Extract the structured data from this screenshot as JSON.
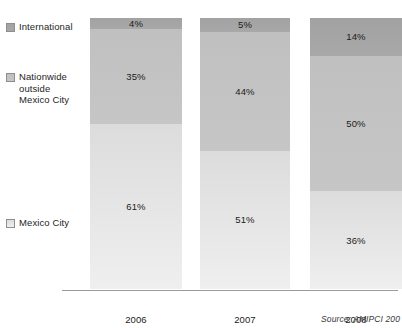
{
  "chart_data": {
    "type": "bar",
    "subtype": "100% stacked column",
    "title": "",
    "xlabel": "",
    "ylabel": "",
    "ylim": [
      0,
      100
    ],
    "grid": false,
    "legend_position": "left",
    "categories": [
      "2006",
      "2007",
      "2008"
    ],
    "category_totals": [
      "$537M USD",
      "$955M USD",
      "$1,768M USD"
    ],
    "series": [
      {
        "name": "International",
        "color": "#a5a5a5",
        "values": [
          4,
          5,
          14
        ],
        "labels": [
          "4%",
          "5%",
          "14%"
        ]
      },
      {
        "name": "Nationwide\noutside\nMexico City",
        "color": "#c3c3c3",
        "values": [
          35,
          44,
          50
        ],
        "labels": [
          "35%",
          "44%",
          "50%"
        ]
      },
      {
        "name": "Mexico City",
        "color": "#e4e4e4",
        "values": [
          61,
          51,
          36
        ],
        "labels": [
          "61%",
          "51%",
          "36%"
        ]
      }
    ],
    "annotations": [
      "Source: AMIPCI 200"
    ]
  },
  "legend": {
    "items": [
      {
        "label": "International",
        "color": "#a5a5a5"
      },
      {
        "label": "Nationwide\noutside\nMexico City",
        "color": "#c3c3c3"
      },
      {
        "label": "Mexico City",
        "color": "#e4e4e4"
      }
    ]
  },
  "bars": [
    {
      "year": "2006",
      "total": "$537M USD",
      "segments": [
        {
          "name": "International",
          "label": "4%",
          "value": 4
        },
        {
          "name": "Nationwide outside Mexico City",
          "label": "35%",
          "value": 35
        },
        {
          "name": "Mexico City",
          "label": "61%",
          "value": 61
        }
      ]
    },
    {
      "year": "2007",
      "total": "$955M USD",
      "segments": [
        {
          "name": "International",
          "label": "5%",
          "value": 5
        },
        {
          "name": "Nationwide outside Mexico City",
          "label": "44%",
          "value": 44
        },
        {
          "name": "Mexico City",
          "label": "51%",
          "value": 51
        }
      ]
    },
    {
      "year": "2008",
      "total": "$1,768M USD",
      "segments": [
        {
          "name": "International",
          "label": "14%",
          "value": 14
        },
        {
          "name": "Nationwide outside Mexico City",
          "label": "50%",
          "value": 50
        },
        {
          "name": "Mexico City",
          "label": "36%",
          "value": 36
        }
      ]
    }
  ],
  "source": {
    "text": "Source: AMIPCI 200"
  }
}
